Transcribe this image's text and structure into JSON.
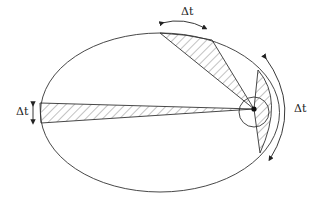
{
  "diagram": {
    "labels": {
      "top": "Δt",
      "left": "Δt",
      "right": "Δt"
    },
    "colors": {
      "stroke": "#333333",
      "hatch": "#555555",
      "background": "#ffffff"
    },
    "elements": [
      "ellipse-orbit",
      "sun-focus",
      "focus-circle",
      "wedge-top",
      "wedge-left",
      "wedge-right",
      "arrow-top",
      "arrow-left",
      "arrow-right"
    ]
  }
}
